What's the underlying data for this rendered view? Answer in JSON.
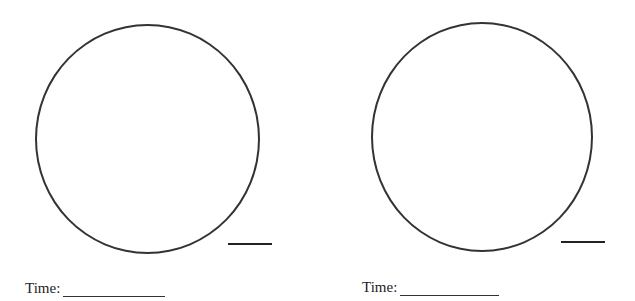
{
  "worksheet": {
    "clocks": [
      {
        "label": "Time:",
        "answer": ""
      },
      {
        "label": "Time:",
        "answer": ""
      }
    ],
    "colors": {
      "stroke": "#333333",
      "background": "#ffffff"
    }
  }
}
